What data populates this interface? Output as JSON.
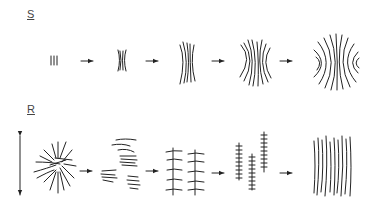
{
  "diagram": {
    "rows": [
      {
        "label": "S",
        "stages": [
          "bundle of parallel chains",
          "small bundle with splayed ends",
          "elongated sheaf",
          "sheaf with curved outer lamellae",
          "fully developed spherulite with eye-shaped centres"
        ],
        "arrow_count": 4
      },
      {
        "label": "R",
        "stages": [
          "random radial spherulite",
          "fragmented stacked lamellae",
          "shish-kebab rows",
          "oriented shish-kebab fibrils",
          "fully oriented fibrillar structure"
        ],
        "arrow_count": 4,
        "side_indicator": "double-headed vertical arrow (stretch direction)"
      }
    ],
    "colors": {
      "ink": "#222222",
      "background": "#ffffff"
    }
  }
}
